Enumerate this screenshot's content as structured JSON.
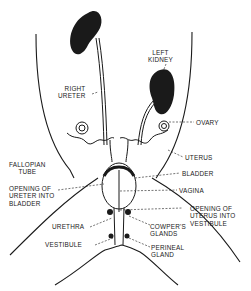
{
  "diagram": {
    "labels": {
      "left_kidney": [
        "LEFT",
        "KIDNEY"
      ],
      "right_ureter": [
        "RIGHT",
        "URETER"
      ],
      "ovary": "OVARY",
      "fallopian_tube": [
        "FALLOPIAN",
        "TUBE"
      ],
      "uterus": "UTERUS",
      "bladder": "BLADDER",
      "opening_ureter": [
        "OPENING OF",
        "URETER INTO",
        "BLADDER"
      ],
      "vagina": "VAGINA",
      "opening_uterus": [
        "OPENING OF",
        "UTERUS INTO",
        "VESTIBULE"
      ],
      "urethra": "URETHRA",
      "cowpers_glands": [
        "COWPER'S",
        "GLANDS"
      ],
      "vestibule": "VESTIBULE",
      "perineal_gland": [
        "PERINEAL",
        "GLAND"
      ]
    },
    "colors": {
      "ink": "#1a1a1a",
      "background": "#ffffff"
    }
  }
}
